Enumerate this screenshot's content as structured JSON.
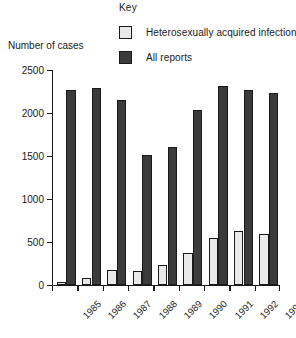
{
  "key": {
    "title": "Key",
    "entries": [
      {
        "label": "Heterosexually acquired infections",
        "swatch": "light",
        "color": "#e9e9e9"
      },
      {
        "label": "All reports",
        "swatch": "dark",
        "color": "#3b3b3b"
      }
    ]
  },
  "axes": {
    "y_title": "Number of cases",
    "y_ticks": [
      "0",
      "500",
      "1000",
      "1500",
      "2000",
      "2500"
    ],
    "x_ticks": [
      "1985",
      "1986",
      "1987",
      "1988",
      "1989",
      "1990",
      "1991",
      "1992",
      "1993"
    ]
  },
  "chart_data": {
    "type": "bar",
    "title": "",
    "subtitle": "",
    "xlabel": "",
    "ylabel": "Number of cases",
    "ylim": [
      0,
      2500
    ],
    "ytick_step": 500,
    "grid": false,
    "legend_title": "Key",
    "legend_position": "top",
    "categories": [
      "1985",
      "1986",
      "1987",
      "1988",
      "1989",
      "1990",
      "1991",
      "1992",
      "1993"
    ],
    "series": [
      {
        "name": "Heterosexually acquired infections",
        "color": "#e9e9e9",
        "values": [
          30,
          80,
          180,
          160,
          230,
          370,
          550,
          630,
          590
        ]
      },
      {
        "name": "All reports",
        "color": "#3b3b3b",
        "values": [
          2270,
          2290,
          2150,
          1510,
          1610,
          2030,
          2310,
          2270,
          2230
        ]
      }
    ]
  }
}
